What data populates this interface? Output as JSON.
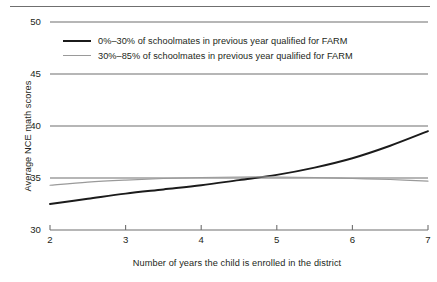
{
  "chart_data": {
    "type": "line",
    "title": "",
    "xlabel": "Number of years the child is enrolled in the district",
    "ylabel": "Average NCE math scores",
    "xlim": [
      2,
      7
    ],
    "ylim": [
      30,
      50
    ],
    "xticks": [
      "2",
      "3",
      "4",
      "5",
      "6",
      "7"
    ],
    "yticks": [
      "30",
      "35",
      "40",
      "45",
      "50"
    ],
    "grid": "horizontal",
    "legend_position": "top-left-inside",
    "x": [
      2,
      2.5,
      3,
      3.5,
      4,
      4.5,
      5,
      5.5,
      6,
      6.5,
      7
    ],
    "series": [
      {
        "name": "0%–30% of schoolmates in previous year qualified for FARM",
        "color": "#1b1b1b",
        "width": 1.9,
        "values": [
          32.5,
          33.0,
          33.5,
          33.9,
          34.3,
          34.8,
          35.3,
          36.0,
          36.9,
          38.1,
          39.5
        ]
      },
      {
        "name": "30%–85% of schoolmates in previous year qualified for FARM",
        "color": "#9a9a9a",
        "width": 1.1,
        "values": [
          34.3,
          34.6,
          34.8,
          34.95,
          35.05,
          35.1,
          35.1,
          35.05,
          34.95,
          34.85,
          34.7
        ]
      }
    ]
  },
  "legend": {
    "items": [
      {
        "label": "0%–30% of schoolmates in previous year qualified for FARM"
      },
      {
        "label": "30%–85% of schoolmates in previous year qualified for FARM"
      }
    ]
  }
}
